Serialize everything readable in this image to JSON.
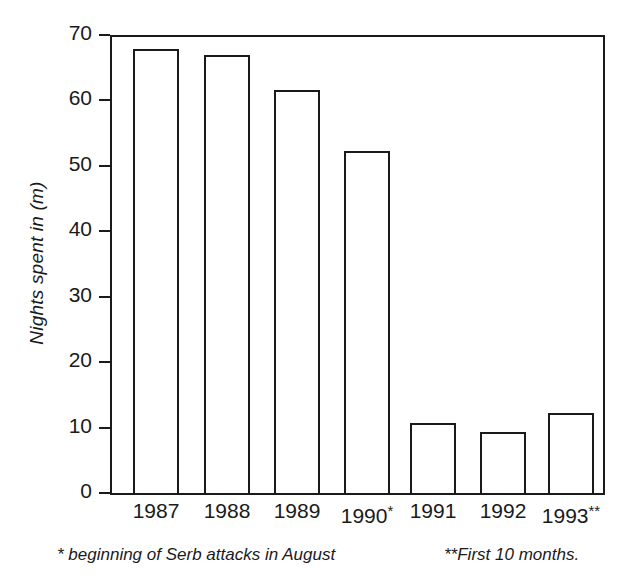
{
  "chart_data": {
    "type": "bar",
    "title": "",
    "subtitle": "",
    "xlabel": "",
    "ylabel": "Nights spent in (m)",
    "categories": [
      "1987",
      "1988",
      "1989",
      "1990",
      "1991",
      "1992",
      "1993"
    ],
    "category_labels": [
      "1987",
      "1988",
      "1989",
      "1990*",
      "1991",
      "1992",
      "1993**"
    ],
    "category_markers": [
      "",
      "",
      "",
      "*",
      "",
      "",
      "**"
    ],
    "values": [
      67.9,
      66.9,
      61.6,
      52.3,
      10.7,
      9.4,
      12.2
    ],
    "ylim": [
      0,
      70
    ],
    "y_ticks": [
      0,
      10,
      20,
      30,
      40,
      50,
      60,
      70
    ],
    "y_tick_labels": [
      "0",
      "10",
      "20",
      "30",
      "40",
      "50",
      "60",
      "70"
    ],
    "grid": false,
    "legend": null,
    "legend_position": "none",
    "bar_fill_color": "#ffffff",
    "bar_edge_color": "#1a1a1a",
    "axis_color": "#1a1a1a",
    "background_color": "#ffffff",
    "annotations": [
      "* beginning of Serb attacks in August",
      "**First 10 months."
    ]
  },
  "axes": {
    "y_title": "Nights spent in (m)"
  },
  "footnotes": {
    "single_star": "* beginning of Serb attacks in August",
    "double_star": "**First 10 months."
  }
}
